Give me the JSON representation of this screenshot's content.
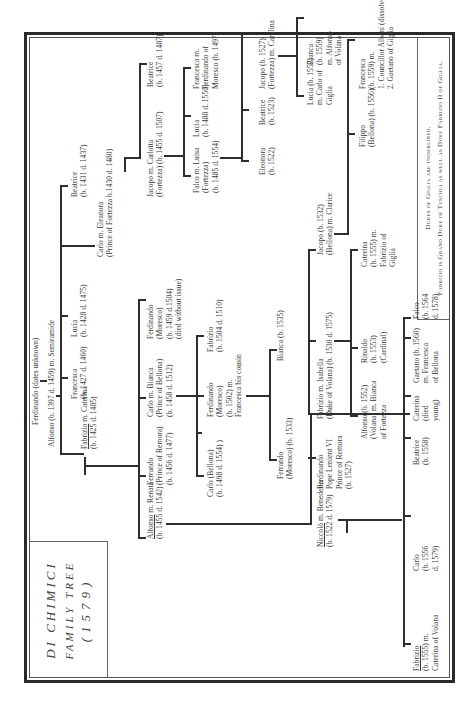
{
  "title": {
    "line1": "DI CHIMICI",
    "line2": "FAMILY TREE",
    "line3": "(1579)"
  },
  "legend": {
    "line1": "Dukes of Giglia are underlined.",
    "line2": "Fabrizio is Grand Duke of Tuschia as well as Duke Fabrizio II of Giglia."
  },
  "people": {
    "ferdinando_root": [
      "Ferdinando (dates unknown)"
    ],
    "alfonso_1397": [
      "Alfonso (b. 1397 d. 1459) m. Semiramide"
    ],
    "fabrizio_1425": {
      "name": "Fabrizio",
      "rest": " m. Caterina",
      "line2": "(b. 1425 d. 1485)"
    },
    "francesca_1427": [
      "Francesca",
      "(b. 1427 d. 1460)"
    ],
    "lucia_1428": [
      "Lucia",
      "(b. 1428 d. 1475)"
    ],
    "carlo_eleanora": [
      "Carlo m. Eleanora",
      "(Prince of Fortezza b.1430 d. 1480)"
    ],
    "beatrice_1431": [
      "Beatrice",
      "(b. 1431 d. 1437)"
    ],
    "alfonso_1455": {
      "name": "Alfonso",
      "rest": " m. Renata",
      "line2": "(b. 1455 d. 1542)"
    },
    "ferrando_1456": [
      "Ferrando",
      "(Prince of Remora)",
      "(b. 1456 d. 1477)"
    ],
    "carlo_bianca_1458": [
      "Carlo m. Bianca",
      "(Prince of Bellona)",
      "(b. 1458 d. 1512)"
    ],
    "ferdinando_1459": [
      "Ferdinando",
      "(Moresco)",
      "(b. 1459 d.1504)",
      "(died without issue)"
    ],
    "jacopo_carlotta_1455": [
      "Jacopo m. Carlotta",
      "(Fortezza) (b. 1455 d. 1507)"
    ],
    "beatrice_1457": [
      "Beatrice",
      "(b. 1457 d. 1487)"
    ],
    "carlo_bellona_1498": [
      "Carlo (Bellona)",
      "(b. 1498 d. 1554) )"
    ],
    "ferdinando_moresco_1502": [
      "Ferdinando",
      "(Moresco)",
      "(b. 1502) m.",
      "Francesca his cousin"
    ],
    "fabrizio_1504": [
      "Fabrizio",
      "(b. 1504 d. 1510)"
    ],
    "falco_luisa_1485": [
      "Falco m. Luisa",
      "(Fortezza)",
      "(b. 1485 d. 1554)"
    ],
    "lucia_1488": [
      "Lucia",
      "(b. 1488 d. 1550)"
    ],
    "francesca_1497": [
      "Francesca m.",
      "Ferdinando of",
      "Moresco (b. 1497)"
    ],
    "ferrando_moresco_1533": [
      "Ferrando",
      "(Moresco) (b. 1533)"
    ],
    "bianca_1535": [
      "Bianca (b. 1535)"
    ],
    "eleonora_1522": [
      "Eleonora",
      "(b. 1522)"
    ],
    "beatrice_1523": [
      "Beatrice",
      "(b. 1523)"
    ],
    "jacopo_carolina_1527": [
      "Jacopo (b. 1527)",
      "(Fortezza) m. Carolina"
    ],
    "niccolo_1522": {
      "name": "Niccolò",
      "rest": " m. Benedetta",
      "line2": "(b. 1522 d. 1579)"
    },
    "ferdinando_pope_1527": [
      "Ferdinando",
      "Pope Lenient VI",
      "Prince of Remora",
      "(b. 1527)"
    ],
    "fabrizio_isabella_1530": [
      "Fabrizio m. Isabella",
      "(Duke of Volana) (b. 1530 d. 1575)"
    ],
    "jacopo_clarice_1532": [
      "Jacopo (b. 1532)",
      "(Bellona) m. Clarice"
    ],
    "lucia_1557": [
      "Lucia (b. 1557)",
      "m. Carlo of",
      "Giglia"
    ],
    "bianca_1559": [
      "Bianca",
      "(b. 1559)",
      "m. Alfonso",
      "of Volana"
    ],
    "alfonso_volana_1552": [
      "Alfonso (b. 1552)",
      "(Volana) m. Bianca",
      "of Fortezza"
    ],
    "rinaldo_1553": [
      "Rinaldo",
      "(b. 1553)",
      "(Cardinal)"
    ],
    "caterina_1555": [
      "Caterina",
      "(b. 1555) m.",
      "Fabrizio of",
      "Giglia"
    ],
    "filippo_1556": [
      "Filippo",
      "(Bellona) (b. 1556)"
    ],
    "francesca_1559": [
      "Francesca",
      "(b. 1559) m.",
      "1. Councillor Albani (dissolved)",
      "2. Gaetano of Giglia"
    ],
    "fabrizio_1555": {
      "name": "Fabrizio",
      "rest": "",
      "line2": "(b. 1555) m.",
      "line3": "Caterina of Volana"
    },
    "carlo_1556": [
      "Carlo",
      "(b. 1556",
      "d. 1579)"
    ],
    "beatrice_1558": [
      "Beatrice",
      "(b. 1558)"
    ],
    "caterina_died_young": [
      "Caterina",
      "(died",
      "young)"
    ],
    "gaetano_1560": [
      "Gaetano (b. 1560)",
      "m. Francesca",
      "of Bellona"
    ],
    "falco_1564": [
      "Falco",
      "(b. 1564",
      "d. 1578)"
    ]
  },
  "colors": {
    "line": "#2e2e2e",
    "text": "#3a3a3a",
    "background": "#ffffff"
  }
}
